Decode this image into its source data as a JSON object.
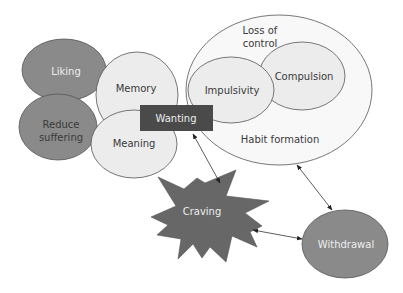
{
  "diagram": {
    "colors": {
      "dark_node": "#8a8a8a",
      "light_node": "#ececec",
      "outer_region": "#f8f8f8",
      "wanting_box": "#4a4a4a",
      "craving_star": "#676767",
      "stroke": "#555555"
    },
    "nodes": {
      "liking": "Liking",
      "reduce_suffering_1": "Reduce",
      "reduce_suffering_2": "suffering",
      "memory": "Memory",
      "meaning": "Meaning",
      "wanting": "Wanting",
      "loss_of_control_1": "Loss of",
      "loss_of_control_2": "control",
      "impulsivity": "Impulsivity",
      "compulsion": "Compulsion",
      "habit_formation": "Habit formation",
      "craving": "Craving",
      "withdrawal": "Withdrawal"
    },
    "edges": [
      {
        "from": "Wanting",
        "to": "Craving",
        "type": "bidirectional"
      },
      {
        "from": "Loss of control / Habit formation",
        "to": "Withdrawal",
        "type": "bidirectional"
      },
      {
        "from": "Craving",
        "to": "Withdrawal",
        "type": "bidirectional"
      }
    ]
  }
}
